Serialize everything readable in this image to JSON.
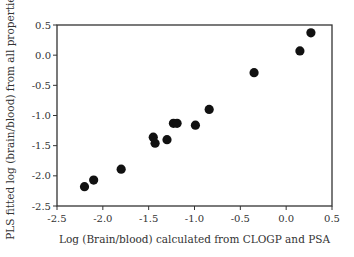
{
  "chart_data": {
    "type": "scatter",
    "title": "",
    "xlabel": "Log (Brain/blood) calculated from CLOGP and PSA",
    "ylabel": "PLS fitted log (brain/blood) from all properties",
    "xlim": [
      -2.5,
      0.5
    ],
    "ylim": [
      -2.5,
      0.5
    ],
    "xticks": [
      -2.5,
      -2.0,
      -1.5,
      -1.0,
      -0.5,
      0.0,
      0.5
    ],
    "xtick_labels": [
      "-2.5",
      "-2.0",
      "-1.5",
      "-1.0",
      "-0.5",
      "0.0",
      "0.5"
    ],
    "yticks": [
      0.5,
      0.0,
      -0.5,
      -1.0,
      -1.5,
      -2.0,
      -2.5
    ],
    "ytick_labels": [
      "0.5",
      "0.0",
      "-0.5",
      "-1.0",
      "-1.5",
      "-2.0",
      "-2.5"
    ],
    "grid": false,
    "legend": null,
    "series": [
      {
        "name": "compounds",
        "color": "#111111",
        "points": [
          {
            "x": -2.2,
            "y": -2.18
          },
          {
            "x": -2.1,
            "y": -2.07
          },
          {
            "x": -1.8,
            "y": -1.89
          },
          {
            "x": -1.45,
            "y": -1.36
          },
          {
            "x": -1.43,
            "y": -1.46
          },
          {
            "x": -1.3,
            "y": -1.4
          },
          {
            "x": -1.23,
            "y": -1.13
          },
          {
            "x": -1.19,
            "y": -1.13
          },
          {
            "x": -0.99,
            "y": -1.16
          },
          {
            "x": -0.84,
            "y": -0.9
          },
          {
            "x": -0.35,
            "y": -0.29
          },
          {
            "x": 0.15,
            "y": 0.07
          },
          {
            "x": 0.27,
            "y": 0.37
          }
        ]
      }
    ]
  }
}
